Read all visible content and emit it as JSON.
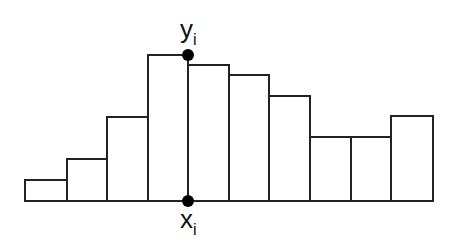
{
  "diagram": {
    "type": "histogram-step-illustration",
    "baseline_y": 201,
    "bars": [
      {
        "x0": 25,
        "x1": 67,
        "top": 180
      },
      {
        "x0": 67,
        "x1": 107,
        "top": 159
      },
      {
        "x0": 107,
        "x1": 148,
        "top": 117
      },
      {
        "x0": 148,
        "x1": 188,
        "top": 55
      },
      {
        "x0": 188,
        "x1": 229,
        "top": 65
      },
      {
        "x0": 229,
        "x1": 269,
        "top": 75
      },
      {
        "x0": 269,
        "x1": 310,
        "top": 96
      },
      {
        "x0": 310,
        "x1": 351,
        "top": 137
      },
      {
        "x0": 351,
        "x1": 391,
        "top": 137
      },
      {
        "x0": 391,
        "x1": 433,
        "top": 116
      }
    ],
    "marker_x": 188,
    "y_label": {
      "base": "y",
      "sub": "i"
    },
    "x_label": {
      "base": "x",
      "sub": "i"
    },
    "colors": {
      "stroke": "#222222",
      "fill": "#ffffff",
      "marker": "#000000"
    }
  }
}
